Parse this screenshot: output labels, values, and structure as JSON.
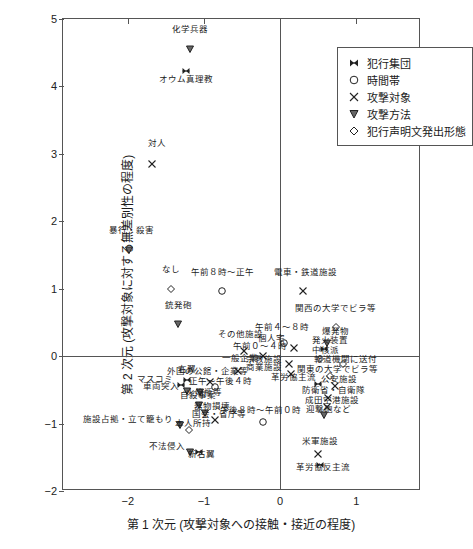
{
  "chart_data": {
    "type": "scatter",
    "title": "",
    "xlabel": "第 1 次元 (攻撃対象への接触・接近の程度)",
    "ylabel": "第 2 次元 (攻撃対象に対する無差別性の程度)",
    "xlim": [
      -2.85,
      1.85
    ],
    "ylim": [
      -2,
      5
    ],
    "xticks": [
      -2,
      -1,
      0,
      1
    ],
    "yticks": [
      -2,
      -1,
      0,
      1,
      2,
      3,
      4,
      5
    ],
    "grid": false,
    "legend_position": "top-right",
    "legend": [
      {
        "symbol": "bowtie",
        "label": "犯行集団"
      },
      {
        "symbol": "circle",
        "label": "時間帯"
      },
      {
        "symbol": "cross",
        "label": "攻撃対象"
      },
      {
        "symbol": "triangle-down",
        "label": "攻撃方法"
      },
      {
        "symbol": "diamond",
        "label": "犯行声明文発出形態"
      }
    ],
    "points": [
      {
        "label": "化学兵器",
        "symbol": "triangle-down",
        "x": -1.18,
        "y": 4.55,
        "lx": -1.18,
        "ly": 4.78,
        "align": "c"
      },
      {
        "label": "オウム真理教",
        "symbol": "bowtie",
        "x": -1.23,
        "y": 4.23,
        "lx": -1.23,
        "ly": 4.03,
        "align": "c"
      },
      {
        "label": "対人",
        "symbol": "cross",
        "x": -1.68,
        "y": 2.85,
        "lx": -1.62,
        "ly": 3.08,
        "align": "c"
      },
      {
        "label": "暴行・殺害",
        "symbol": "triangle-down",
        "x": -1.98,
        "y": 1.58,
        "lx": -1.95,
        "ly": 1.8,
        "align": "c"
      },
      {
        "label": "なし",
        "symbol": "diamond",
        "x": -1.43,
        "y": 1.0,
        "lx": -1.43,
        "ly": 1.22,
        "align": "c"
      },
      {
        "label": "午前８時～正午",
        "symbol": "circle",
        "x": -0.76,
        "y": 0.97,
        "lx": -0.76,
        "ly": 1.18,
        "align": "c"
      },
      {
        "label": "電車・鉄道施設",
        "symbol": "cross",
        "x": 0.3,
        "y": 0.97,
        "lx": 0.33,
        "ly": 1.18,
        "align": "c"
      },
      {
        "label": "銃発砲",
        "symbol": "triangle-down",
        "x": -1.34,
        "y": 0.47,
        "lx": -1.34,
        "ly": 0.68,
        "align": "c"
      },
      {
        "label": "関西の大学でビラ等",
        "symbol": "diamond",
        "x": 0.73,
        "y": 0.43,
        "lx": 0.73,
        "ly": 0.64,
        "align": "c"
      },
      {
        "label": "爆発物",
        "symbol": "triangle-down",
        "x": 0.62,
        "y": 0.2,
        "lx": 0.73,
        "ly": 0.3,
        "align": "c"
      },
      {
        "label": "その他施設",
        "symbol": "cross",
        "x": -0.48,
        "y": 0.07,
        "lx": -0.52,
        "ly": 0.25,
        "align": "c"
      },
      {
        "label": "午前４～８時",
        "symbol": "circle",
        "x": 0.05,
        "y": 0.2,
        "lx": 0.02,
        "ly": 0.36,
        "align": "c"
      },
      {
        "label": "個人宅",
        "symbol": "cross",
        "x": 0.18,
        "y": 0.12,
        "lx": 0.06,
        "ly": 0.19,
        "align": "r"
      },
      {
        "label": "発火装置",
        "symbol": "bowtie",
        "x": 0.57,
        "y": 0.11,
        "lx": 0.66,
        "ly": 0.17,
        "align": "c"
      },
      {
        "label": "午前０～４時",
        "symbol": "cross",
        "x": -0.23,
        "y": 0.0,
        "lx": -0.26,
        "ly": 0.07,
        "align": "c"
      },
      {
        "label": "中核派",
        "symbol": "diamond",
        "x": 0.52,
        "y": -0.04,
        "lx": 0.6,
        "ly": 0.02,
        "align": "c"
      },
      {
        "label": "一般企業",
        "symbol": "cross",
        "x": -0.55,
        "y": -0.22,
        "lx": -0.52,
        "ly": -0.1,
        "align": "c"
      },
      {
        "label": "宗教施設",
        "symbol": "cross",
        "x": 0.12,
        "y": -0.12,
        "lx": 0.02,
        "ly": -0.11,
        "align": "r"
      },
      {
        "label": "報道機関に送付",
        "symbol": "diamond",
        "x": 0.82,
        "y": -0.12,
        "lx": 0.86,
        "ly": -0.12,
        "align": "c"
      },
      {
        "label": "商業施設",
        "symbol": "cross",
        "x": 0.14,
        "y": -0.26,
        "lx": 0.02,
        "ly": -0.24,
        "align": "r"
      },
      {
        "label": "関東の大学でビラ等",
        "symbol": "diamond",
        "x": 0.66,
        "y": -0.3,
        "lx": 0.75,
        "ly": -0.26,
        "align": "c"
      },
      {
        "label": "革労協主流",
        "symbol": "bowtie",
        "x": 0.5,
        "y": -0.42,
        "lx": 0.18,
        "ly": -0.38,
        "align": "c"
      },
      {
        "label": "公安施設",
        "symbol": "cross",
        "x": 0.72,
        "y": -0.44,
        "lx": 0.78,
        "ly": -0.42,
        "align": "c"
      },
      {
        "label": "マスコミ",
        "symbol": "bowtie",
        "x": -1.3,
        "y": -0.43,
        "lx": -1.4,
        "ly": -0.41,
        "align": "r"
      },
      {
        "label": "右翼",
        "symbol": "bowtie",
        "x": -1.22,
        "y": -0.35,
        "lx": -1.22,
        "ly": -0.26,
        "align": "c"
      },
      {
        "label": "外国の公館・企業等",
        "symbol": "cross",
        "x": -0.92,
        "y": -0.38,
        "lx": -0.95,
        "ly": -0.29,
        "align": "c"
      },
      {
        "label": "正午～午後４時",
        "symbol": "circle",
        "x": -0.85,
        "y": -0.46,
        "lx": -0.78,
        "ly": -0.44,
        "align": "c"
      },
      {
        "label": "車両突入",
        "symbol": "triangle-down",
        "x": -1.22,
        "y": -0.52,
        "lx": -1.33,
        "ly": -0.52,
        "align": "r"
      },
      {
        "label": "火焔瓶等",
        "symbol": "triangle-down",
        "x": -1.05,
        "y": -0.53,
        "lx": -1.0,
        "ly": -0.6,
        "align": "c"
      },
      {
        "label": "防衛省・自衛隊",
        "symbol": "cross",
        "x": 0.63,
        "y": -0.62,
        "lx": 0.7,
        "ly": -0.58,
        "align": "c"
      },
      {
        "label": "成田空港施設",
        "symbol": "cross",
        "x": 0.61,
        "y": -0.76,
        "lx": 0.68,
        "ly": -0.72,
        "align": "c"
      },
      {
        "label": "迎撃砲など",
        "symbol": "triangle-down",
        "x": 0.58,
        "y": -0.88,
        "lx": 0.63,
        "ly": -0.86,
        "align": "c"
      },
      {
        "label": "自殺事案",
        "symbol": "triangle-down",
        "x": -1.06,
        "y": -0.72,
        "lx": -1.08,
        "ly": -0.65,
        "align": "c"
      },
      {
        "label": "器物損壊",
        "symbol": "triangle-down",
        "x": -0.98,
        "y": -0.85,
        "lx": -0.9,
        "ly": -0.82,
        "align": "c"
      },
      {
        "label": "国会・省庁等",
        "symbol": "cross",
        "x": -0.86,
        "y": -0.95,
        "lx": -0.8,
        "ly": -0.93,
        "align": "c"
      },
      {
        "label": "午後８時～午前０時",
        "symbol": "circle",
        "x": -0.23,
        "y": -0.98,
        "lx": -0.26,
        "ly": -0.87,
        "align": "c"
      },
      {
        "label": "施設占拠・立て籠もり",
        "symbol": "triangle-down",
        "x": -1.32,
        "y": -1.02,
        "lx": -1.4,
        "ly": -1.0,
        "align": "r"
      },
      {
        "label": "本人所持",
        "symbol": "diamond",
        "x": -1.2,
        "y": -1.09,
        "lx": -1.14,
        "ly": -1.06,
        "align": "c"
      },
      {
        "label": "不法侵入",
        "symbol": "triangle-down",
        "x": -1.18,
        "y": -1.42,
        "lx": -1.25,
        "ly": -1.4,
        "align": "r"
      },
      {
        "label": "新右翼",
        "symbol": "bowtie",
        "x": -1.06,
        "y": -1.42,
        "lx": -1.03,
        "ly": -1.52,
        "align": "c"
      },
      {
        "label": "米軍施設",
        "symbol": "cross",
        "x": 0.5,
        "y": -1.45,
        "lx": 0.53,
        "ly": -1.34,
        "align": "c"
      },
      {
        "label": "革労協反主流",
        "symbol": "bowtie",
        "x": 0.52,
        "y": -1.62,
        "lx": 0.56,
        "ly": -1.72,
        "align": "c"
      }
    ]
  }
}
